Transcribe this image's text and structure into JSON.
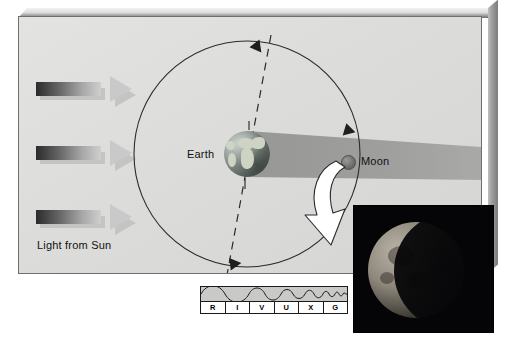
{
  "figure": {
    "type": "lunar-eclipse-diagram",
    "labels": {
      "earth": "Earth",
      "moon": "Moon",
      "light_source": "Light from Sun"
    },
    "panel_color": "#dcdcda",
    "shadow_color": "#9b9b99"
  },
  "sun_arrows": [
    {
      "name": "sun-ray-top",
      "gradient_from": "#2b2b2b",
      "gradient_to": "#cfcfcf"
    },
    {
      "name": "sun-ray-middle",
      "gradient_from": "#2b2b2b",
      "gradient_to": "#cfcfcf"
    },
    {
      "name": "sun-ray-bottom",
      "gradient_from": "#2b2b2b",
      "gradient_to": "#cfcfcf"
    }
  ],
  "orbit": {
    "name": "moon-orbit",
    "direction_arrows": 3,
    "node_line_style": "dashed"
  },
  "photo": {
    "caption": "",
    "subject": "partially eclipsed moon"
  },
  "spectrum": {
    "name": "R I V U X G spectrum bar",
    "bands": [
      "R",
      "I",
      "V",
      "U",
      "X",
      "G"
    ],
    "band_names": [
      "Radio",
      "Infrared",
      "Visible",
      "Ultraviolet",
      "X-ray",
      "Gamma ray"
    ]
  }
}
